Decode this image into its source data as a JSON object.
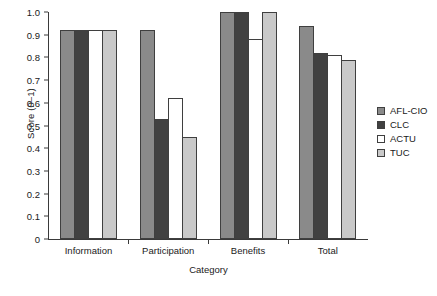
{
  "chart_data": {
    "type": "bar",
    "title": "",
    "xlabel": "Category",
    "ylabel": "Score (0–1)",
    "ylim": [
      0,
      1.0
    ],
    "grid": false,
    "legend_position": "right",
    "categories": [
      "Information",
      "Participation",
      "Benefits",
      "Total"
    ],
    "ytick_labels": [
      "0",
      "0.1",
      "0.2",
      "0.3",
      "0.4",
      "0.5",
      "0.6",
      "0.7",
      "0.8",
      "0.9",
      "1.0"
    ],
    "ytick_values": [
      0,
      0.1,
      0.2,
      0.3,
      0.4,
      0.5,
      0.6,
      0.7,
      0.8,
      0.9,
      1.0
    ],
    "series": [
      {
        "name": "AFL-CIO",
        "color": "#8a8a8a",
        "values": [
          0.92,
          0.92,
          1.0,
          0.94
        ]
      },
      {
        "name": "CLC",
        "color": "#414141",
        "values": [
          0.92,
          0.53,
          1.0,
          0.82
        ]
      },
      {
        "name": "ACTU",
        "color": "#ffffff",
        "values": [
          0.92,
          0.62,
          0.88,
          0.81
        ]
      },
      {
        "name": "TUC",
        "color": "#c9c9c9",
        "values": [
          0.92,
          0.45,
          1.0,
          0.79
        ]
      }
    ]
  }
}
